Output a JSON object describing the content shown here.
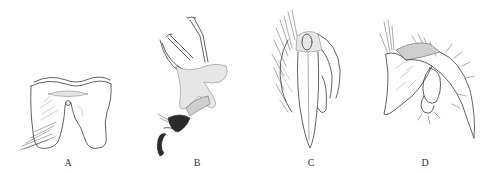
{
  "figure": {
    "background": "#ffffff",
    "ink_color": "#3a3a3a",
    "panels": [
      {
        "id": "A",
        "label": "A",
        "subject": "tergite-plate-dorsal-view"
      },
      {
        "id": "B",
        "label": "B",
        "subject": "genital-structure-lateral-view"
      },
      {
        "id": "C",
        "label": "C",
        "subject": "genital-capsule-ventral-view"
      },
      {
        "id": "D",
        "label": "D",
        "subject": "genital-capsule-lateral-view"
      }
    ]
  }
}
